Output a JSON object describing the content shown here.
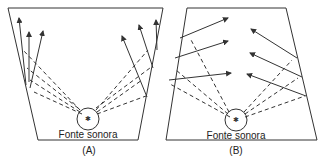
{
  "diagram": {
    "panels": [
      {
        "id": "A",
        "caption": "(A)",
        "source_label": "Fonte sonora",
        "description": "Room with diverging walls; reflected rays converge upward along walls"
      },
      {
        "id": "B",
        "caption": "(B)",
        "source_label": "Fonte sonora",
        "description": "Room with splayed walls; reflected rays directed toward the center"
      }
    ],
    "colors": {
      "line": "#333333",
      "background": "#ffffff"
    }
  }
}
